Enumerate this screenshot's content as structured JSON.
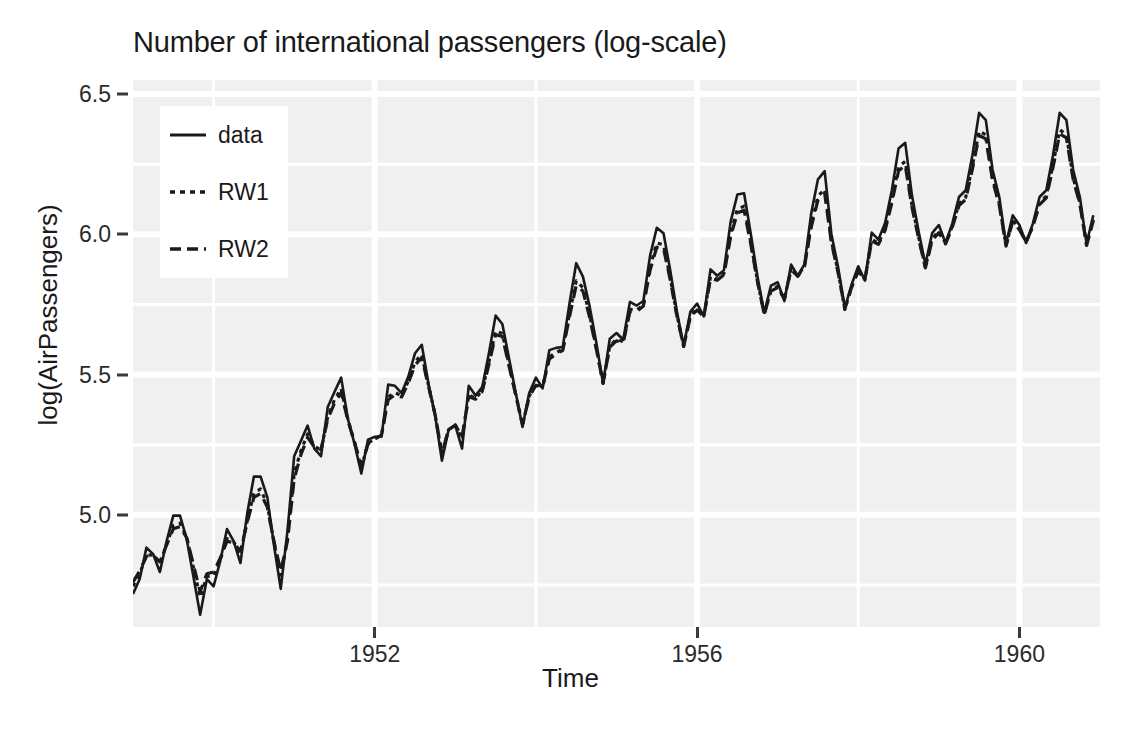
{
  "chart_data": {
    "type": "line",
    "title": "Number of international passengers (log-scale)",
    "xlabel": "Time",
    "ylabel": "log(AirPassengers)",
    "grid": true,
    "legend_position": "top-left inside panel",
    "xlim": [
      1949.0,
      1961.0
    ],
    "ylim": [
      4.6,
      6.55
    ],
    "x_ticks": [
      1952,
      1956,
      1960
    ],
    "x_tick_labels": [
      "1952",
      "1956",
      "1960"
    ],
    "y_ticks": [
      5.0,
      5.5,
      6.0,
      6.5
    ],
    "y_tick_labels": [
      "5.0",
      "5.5",
      "6.0",
      "6.5"
    ],
    "x_minor_ticks": [
      1950,
      1954,
      1958
    ],
    "y_minor_ticks": [
      4.75,
      5.25,
      5.75,
      6.25
    ],
    "x_start": 1949.0,
    "x_step": 0.0833333,
    "series": [
      {
        "name": "data",
        "linestyle": "solid",
        "color": "#1a1a1a",
        "values": [
          4.718,
          4.771,
          4.883,
          4.86,
          4.796,
          4.905,
          4.997,
          4.997,
          4.913,
          4.779,
          4.644,
          4.771,
          4.745,
          4.836,
          4.949,
          4.905,
          4.828,
          5.004,
          5.136,
          5.136,
          5.063,
          4.89,
          4.736,
          4.942,
          5.209,
          5.263,
          5.318,
          5.236,
          5.209,
          5.384,
          5.438,
          5.489,
          5.342,
          5.252,
          5.147,
          5.268,
          5.278,
          5.278,
          5.464,
          5.46,
          5.434,
          5.493,
          5.576,
          5.606,
          5.468,
          5.352,
          5.193,
          5.303,
          5.318,
          5.236,
          5.46,
          5.425,
          5.455,
          5.576,
          5.71,
          5.68,
          5.557,
          5.434,
          5.313,
          5.434,
          5.489,
          5.451,
          5.587,
          5.595,
          5.598,
          5.753,
          5.897,
          5.849,
          5.743,
          5.613,
          5.468,
          5.628,
          5.648,
          5.624,
          5.759,
          5.746,
          5.762,
          5.924,
          6.023,
          6.004,
          5.872,
          5.724,
          5.602,
          5.724,
          5.753,
          5.707,
          5.875,
          5.852,
          5.872,
          6.045,
          6.142,
          6.146,
          6.001,
          5.849,
          5.72,
          5.817,
          5.829,
          5.762,
          5.892,
          5.852,
          5.894,
          6.075,
          6.196,
          6.225,
          6.001,
          5.883,
          5.737,
          5.82,
          5.886,
          5.835,
          6.006,
          5.981,
          6.04,
          6.157,
          6.306,
          6.326,
          6.138,
          6.009,
          5.892,
          6.004,
          6.033,
          5.969,
          6.038,
          6.133,
          6.157,
          6.282,
          6.433,
          6.407,
          6.23,
          6.133,
          5.966,
          6.068,
          6.033,
          5.969,
          6.038,
          6.133,
          6.157,
          6.282,
          6.433,
          6.407,
          6.23,
          6.133,
          5.966,
          6.068
        ]
      },
      {
        "name": "RW1",
        "linestyle": "dotted",
        "color": "#1a1a1a",
        "values": [
          4.745,
          4.79,
          4.856,
          4.857,
          4.824,
          4.895,
          4.962,
          4.97,
          4.92,
          4.812,
          4.706,
          4.78,
          4.782,
          4.84,
          4.915,
          4.903,
          4.862,
          4.977,
          5.078,
          5.092,
          5.036,
          4.9,
          4.785,
          4.913,
          5.147,
          5.228,
          5.288,
          5.245,
          5.23,
          5.35,
          5.41,
          5.45,
          5.34,
          5.257,
          5.167,
          5.255,
          5.272,
          5.283,
          5.42,
          5.436,
          5.424,
          5.477,
          5.545,
          5.572,
          5.462,
          5.356,
          5.214,
          5.304,
          5.32,
          5.27,
          5.428,
          5.414,
          5.444,
          5.545,
          5.656,
          5.646,
          5.536,
          5.428,
          5.32,
          5.423,
          5.468,
          5.456,
          5.563,
          5.578,
          5.59,
          5.717,
          5.834,
          5.81,
          5.712,
          5.594,
          5.468,
          5.602,
          5.626,
          5.617,
          5.732,
          5.73,
          5.748,
          5.884,
          5.969,
          5.963,
          5.846,
          5.712,
          5.6,
          5.71,
          5.736,
          5.707,
          5.85,
          5.84,
          5.86,
          6.004,
          6.09,
          6.1,
          5.972,
          5.834,
          5.714,
          5.802,
          5.814,
          5.768,
          5.878,
          5.852,
          5.888,
          6.036,
          6.136,
          6.16,
          5.976,
          5.868,
          5.732,
          5.812,
          5.872,
          5.838,
          5.982,
          5.968,
          6.02,
          6.122,
          6.24,
          6.26,
          6.104,
          5.99,
          5.882,
          5.984,
          6.012,
          5.968,
          6.028,
          6.11,
          6.132,
          6.244,
          6.368,
          6.354,
          6.2,
          6.11,
          5.96,
          6.05,
          6.02,
          5.972,
          6.03,
          6.112,
          6.136,
          6.248,
          6.372,
          6.356,
          6.202,
          6.112,
          5.962,
          6.052
        ]
      },
      {
        "name": "RW2",
        "linestyle": "dashed",
        "color": "#1a1a1a",
        "values": [
          4.76,
          4.8,
          4.852,
          4.856,
          4.832,
          4.892,
          4.95,
          4.958,
          4.918,
          4.822,
          4.726,
          4.79,
          4.796,
          4.846,
          4.906,
          4.9,
          4.87,
          4.972,
          5.062,
          5.076,
          5.028,
          4.904,
          4.8,
          4.906,
          5.128,
          5.214,
          5.276,
          5.242,
          5.232,
          5.342,
          5.398,
          5.436,
          5.336,
          5.258,
          5.174,
          5.252,
          5.27,
          5.284,
          5.41,
          5.428,
          5.42,
          5.47,
          5.534,
          5.56,
          5.458,
          5.356,
          5.22,
          5.304,
          5.32,
          5.278,
          5.422,
          5.412,
          5.44,
          5.536,
          5.642,
          5.636,
          5.53,
          5.426,
          5.322,
          5.42,
          5.462,
          5.456,
          5.556,
          5.572,
          5.586,
          5.706,
          5.818,
          5.798,
          5.704,
          5.59,
          5.47,
          5.598,
          5.62,
          5.614,
          5.724,
          5.724,
          5.744,
          5.872,
          5.954,
          5.95,
          5.838,
          5.708,
          5.6,
          5.706,
          5.73,
          5.706,
          5.842,
          5.836,
          5.856,
          5.992,
          6.076,
          6.086,
          5.964,
          5.83,
          5.714,
          5.798,
          5.81,
          5.77,
          5.874,
          5.85,
          5.886,
          6.026,
          6.122,
          6.146,
          5.97,
          5.864,
          5.734,
          5.81,
          5.868,
          5.84,
          5.976,
          5.964,
          6.014,
          6.112,
          6.226,
          6.246,
          6.096,
          5.984,
          5.88,
          5.978,
          6.006,
          5.966,
          6.024,
          6.102,
          6.124,
          6.232,
          6.352,
          6.34,
          6.192,
          6.104,
          5.958,
          6.046,
          6.016,
          5.972,
          6.028,
          6.106,
          6.13,
          6.238,
          6.358,
          6.344,
          6.196,
          6.108,
          5.96,
          6.048
        ]
      }
    ]
  },
  "legend": {
    "items": [
      {
        "label": "data",
        "style": "solid"
      },
      {
        "label": "RW1",
        "style": "dotted"
      },
      {
        "label": "RW2",
        "style": "dashed"
      }
    ]
  },
  "style": {
    "panel_background": "#f0f0f0",
    "gridline_color": "#ffffff",
    "line_color": "#1a1a1a",
    "text_color": "#1a1a1a",
    "page_background": "#ffffff"
  }
}
